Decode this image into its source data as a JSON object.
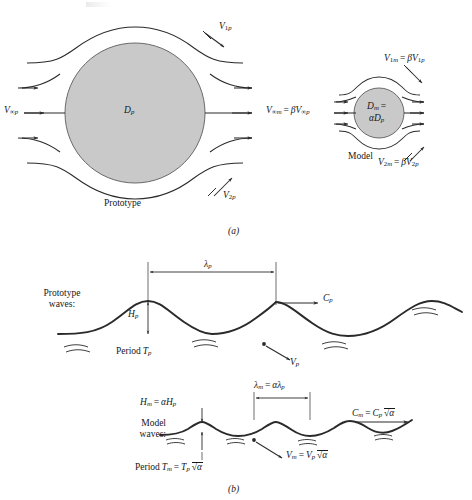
{
  "figure": {
    "panels": [
      {
        "id": "a",
        "caption": "(a)",
        "description": "Flow past a sphere — prototype and geometrically similar model",
        "items": {
          "prototype_label": "Prototype",
          "model_label": "Model",
          "prototype_diameter": "D p",
          "prototype_freestream": "V∞p",
          "prototype_v1": "V1p",
          "prototype_v2": "V2p",
          "model_diameter_line1": "Dm =",
          "model_diameter_line2": "αDp",
          "model_freestream": "V∞m = βV∞p",
          "model_v1": "V1m = βV1p",
          "model_v2": "V2m = βV2p"
        }
      },
      {
        "id": "b",
        "caption": "(b)",
        "description": "Water waves — prototype waves and scaled model waves",
        "items": {
          "prototype_waves_label_line1": "Prototype",
          "prototype_waves_label_line2": "waves:",
          "model_waves_label_line1": "Model",
          "model_waves_label_line2": "waves:",
          "prototype_wavelength": "λp",
          "prototype_height": "Hp",
          "prototype_celerity": "Cp",
          "prototype_velocity": "Vp",
          "prototype_period": "Period Tp",
          "model_wavelength": "λm = αλp",
          "model_height": "Hm = αHp",
          "model_celerity": "Cm = Cp√α",
          "model_velocity": "Vm = Vp√α",
          "model_period": "Period Tm = Tp√α"
        }
      }
    ],
    "symbols": {
      "alpha": "α",
      "beta": "β",
      "lambda": "λ",
      "infinity": "∞",
      "sqrt": "√"
    },
    "colors": {
      "sphere_fill": "#c9c9c9",
      "sphere_stroke": "#4a4a4a",
      "line": "#2a2a2a",
      "background": "#ffffff",
      "text": "#17171a"
    }
  }
}
